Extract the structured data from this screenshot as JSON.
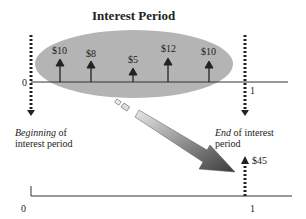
{
  "title": "Interest Period",
  "top_timeline": {
    "start_label": "0",
    "end_label": "1",
    "cash_flows": [
      {
        "label": "$10",
        "x": 60,
        "height": 22
      },
      {
        "label": "$8",
        "x": 91,
        "height": 20
      },
      {
        "label": "$5",
        "x": 133,
        "height": 14
      },
      {
        "label": "$12",
        "x": 168,
        "height": 24
      },
      {
        "label": "$10",
        "x": 209,
        "height": 20
      }
    ]
  },
  "annotations": {
    "beginning_em": "Beginning",
    "beginning_rest": " of",
    "beginning_line2": "interest period",
    "end_em": "End",
    "end_rest": " of interest",
    "end_line2": "period"
  },
  "bottom_timeline": {
    "start_label": "0",
    "end_label": "1",
    "total_label": "$45"
  },
  "colors": {
    "ellipse": "#b4b4b4",
    "arrow_dark": "#444444",
    "arrow_light": "#d8d8d8",
    "line": "#333333"
  }
}
